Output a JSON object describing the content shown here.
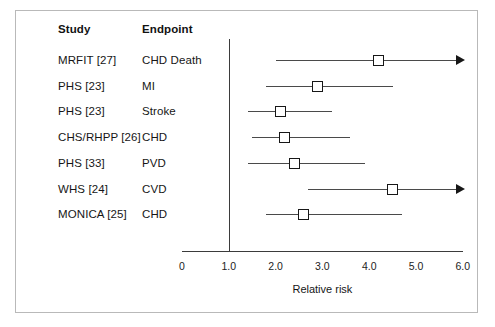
{
  "figure": {
    "headers": {
      "study": "Study",
      "endpoint": "Endpoint"
    },
    "x_axis_title": "Relative risk"
  },
  "chart_data": {
    "type": "scatter",
    "title": "",
    "xlabel": "Relative risk",
    "ylabel": "",
    "xlim": [
      0,
      6.0
    ],
    "grid": false,
    "legend": "none",
    "reference_line": 1.0,
    "tick_labels": [
      "0",
      "1.0",
      "2.0",
      "3.0",
      "4.0",
      "5.0",
      "6.0"
    ],
    "tick_values": [
      0,
      1.0,
      2.0,
      3.0,
      4.0,
      5.0,
      6.0
    ],
    "columns": [
      "Study",
      "Endpoint",
      "Relative risk",
      "CI low",
      "CI high"
    ],
    "rows": [
      {
        "study": "MRFIT [27]",
        "endpoint": "CHD Death",
        "estimate": 4.2,
        "ci_low": 2.0,
        "ci_high": 6.0,
        "truncated_high": true
      },
      {
        "study": "PHS [23]",
        "endpoint": "MI",
        "estimate": 2.9,
        "ci_low": 1.8,
        "ci_high": 4.5,
        "truncated_high": false
      },
      {
        "study": "PHS [23]",
        "endpoint": "Stroke",
        "estimate": 2.1,
        "ci_low": 1.4,
        "ci_high": 3.2,
        "truncated_high": false
      },
      {
        "study": "CHS/RHPP [26]",
        "endpoint": "CHD",
        "estimate": 2.2,
        "ci_low": 1.5,
        "ci_high": 3.6,
        "truncated_high": false
      },
      {
        "study": "PHS [33]",
        "endpoint": "PVD",
        "estimate": 2.4,
        "ci_low": 1.4,
        "ci_high": 3.9,
        "truncated_high": false
      },
      {
        "study": "WHS [24]",
        "endpoint": "CVD",
        "estimate": 4.5,
        "ci_low": 2.7,
        "ci_high": 6.0,
        "truncated_high": true
      },
      {
        "study": "MONICA [25]",
        "endpoint": "CHD",
        "estimate": 2.6,
        "ci_low": 1.8,
        "ci_high": 4.7,
        "truncated_high": false
      }
    ]
  }
}
